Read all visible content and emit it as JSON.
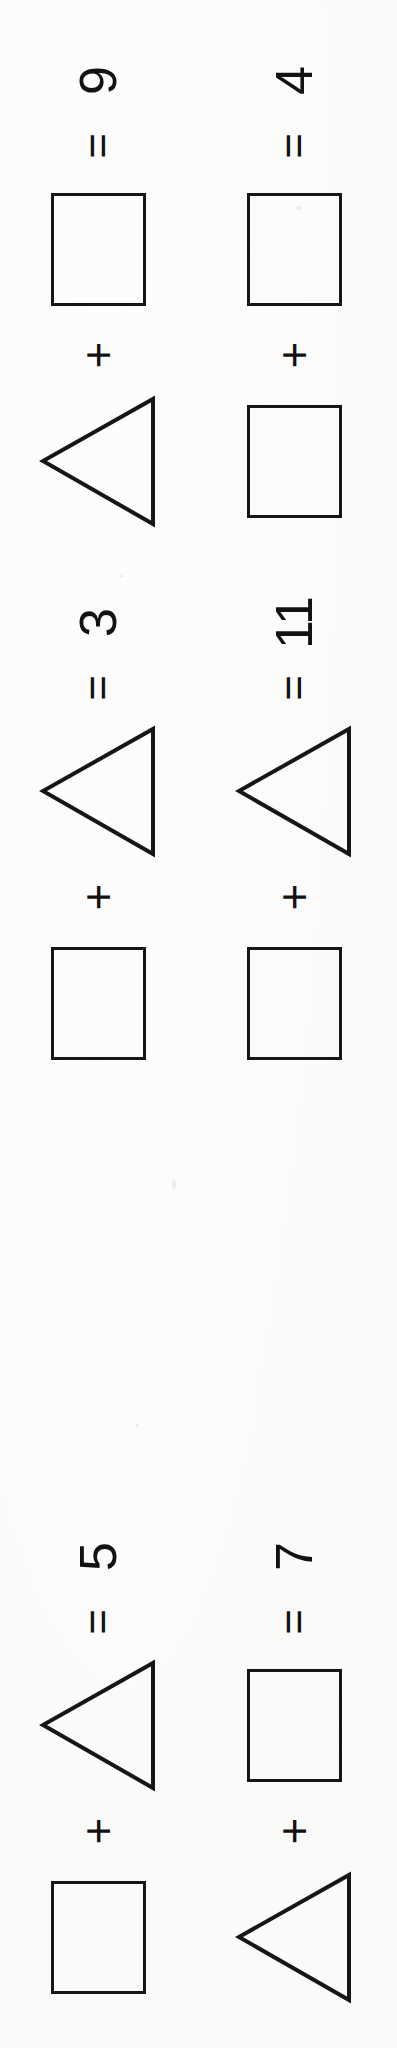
{
  "page": {
    "orientation": "rotated-90-ccw",
    "background_color": "#fefefe",
    "ink_color": "#161616"
  },
  "symbols": {
    "equals": "=",
    "plus": "+",
    "square_name": "square",
    "triangle_name": "triangle"
  },
  "equations": [
    {
      "id": "eq-1",
      "answer": "9",
      "equals": "=",
      "operator": "+",
      "first_shape": "square",
      "second_shape": "triangle",
      "group": 1,
      "column": 1
    },
    {
      "id": "eq-2",
      "answer": "4",
      "equals": "=",
      "operator": "+",
      "first_shape": "square",
      "second_shape": "square",
      "group": 1,
      "column": 2
    },
    {
      "id": "eq-3",
      "answer": "3",
      "equals": "=",
      "operator": "+",
      "first_shape": "triangle",
      "second_shape": "square",
      "group": 2,
      "column": 1
    },
    {
      "id": "eq-4",
      "answer": "11",
      "equals": "=",
      "operator": "+",
      "first_shape": "triangle",
      "second_shape": "square",
      "group": 2,
      "column": 2
    },
    {
      "id": "eq-5",
      "answer": "5",
      "equals": "=",
      "operator": "+",
      "first_shape": "triangle",
      "second_shape": "square",
      "group": 3,
      "column": 1
    },
    {
      "id": "eq-6",
      "answer": "7",
      "equals": "=",
      "operator": "+",
      "first_shape": "square",
      "second_shape": "triangle",
      "group": 3,
      "column": 2
    }
  ]
}
